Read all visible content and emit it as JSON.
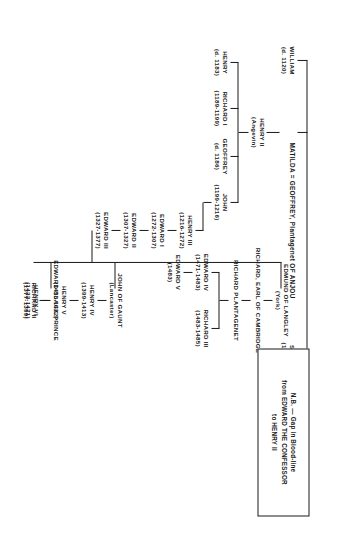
{
  "document": {
    "kind": "genealogy-chart",
    "subject": "Plantagenet royal descent",
    "orientation": "rotated-90-clockwise"
  },
  "note": {
    "line1": "N.B. — Gap in Blood-line",
    "line2": "from EDWARD THE CONFESSOR",
    "line3": "to HENRY II"
  },
  "nodes": {
    "stephen": {
      "name": "STEPHEN",
      "dates": "(1135-1154)"
    },
    "william": {
      "name": "WILLIAM",
      "dates": "(d. 1120)"
    },
    "matilda_line": {
      "name": "MATILDA  =  GEOFFREY, Plantagenet OF ANJOU"
    },
    "henry2": {
      "name": "HENRY II",
      "dates": "(Angevin)"
    },
    "john": {
      "name": "JOHN",
      "dates": "(1199-1216)"
    },
    "geoffrey": {
      "name": "GEOFFREY",
      "dates": "(d. 1186)"
    },
    "richard1": {
      "name": "RICHARD I",
      "dates": "(1189-1199)"
    },
    "henry_d1183": {
      "name": "HENRY",
      "dates": "(d. 1183)"
    },
    "henry3": {
      "name": "HENRY III",
      "dates": "(1216-1272)"
    },
    "edward1": {
      "name": "EDWARD I",
      "dates": "(1272-1307)"
    },
    "edward2": {
      "name": "EDWARD II",
      "dates": "(1307-1327)"
    },
    "edward3": {
      "name": "EDWARD III",
      "dates": "(1327-1377)"
    },
    "black_prince": {
      "name": "EDWARD BLACK PRINCE",
      "dates": ""
    },
    "richard2": {
      "name": "RICHARD II",
      "dates": "(1377-1399)"
    },
    "john_gaunt": {
      "name": "JOHN OF GAUNT",
      "dates": "(Lancaster)"
    },
    "henry4": {
      "name": "HENRY IV",
      "dates": "(1399-1413)"
    },
    "henry5": {
      "name": "HENRY V",
      "dates": "(1413-1422)"
    },
    "henry6": {
      "name": "HENRY VI",
      "dates": "(1422-1471)"
    },
    "edmund_langley": {
      "name": "EDMUND OF LANGLEY",
      "dates": "(York)"
    },
    "richard_cambridge": {
      "name": "RICHARD, EARL OF CAMBRIDGE",
      "dates": ""
    },
    "richard_plantagenet": {
      "name": "RICHARD PLANTAGENET",
      "dates": ""
    },
    "edward4": {
      "name": "EDWARD IV",
      "dates": "(1471-1483)"
    },
    "edward5": {
      "name": "EDWARD V",
      "dates": "(1483)"
    },
    "richard3": {
      "name": "RICHARD III",
      "dates": "(1483-1485)"
    }
  },
  "colors": {
    "ink": "#1a1a1a",
    "paper": "#ffffff"
  }
}
